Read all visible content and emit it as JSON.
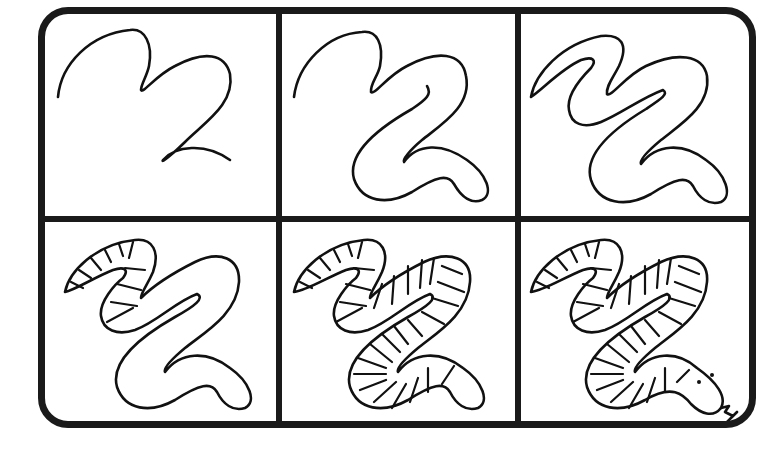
{
  "grid": {
    "rows": 2,
    "cols": 3,
    "border_color": "#1a1a1a",
    "background": "#ffffff"
  },
  "steps": [
    {
      "step": 1,
      "description": "Two curved guide lines forming the S-shaped body path"
    },
    {
      "step": 2,
      "description": "Body outline thickened around the lower curve with rounded tail end"
    },
    {
      "step": 3,
      "description": "Full body outline closed including tapered head end"
    },
    {
      "step": 4,
      "description": "Stripe segments added to the upper-left portion of the body"
    },
    {
      "step": 5,
      "description": "Stripe segments added along the entire body"
    },
    {
      "step": 6,
      "description": "Head with two eyes and forked tongue added"
    }
  ]
}
